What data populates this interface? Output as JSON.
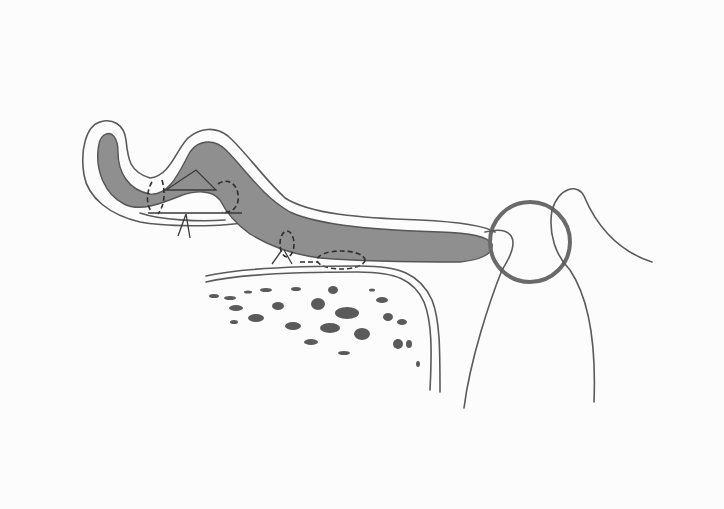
{
  "figure": {
    "type": "anatomical-illustration",
    "style": "hand-drawn pencil sketch, grayscale",
    "labels": [],
    "colors": {
      "background": "#fcfcfc",
      "tissue_fill": "#8f8f8f",
      "outline": "#5a5a5a",
      "dashed_marks": "#2e2e2e",
      "ring": "#6a6a6a"
    },
    "elements": [
      {
        "id": "folded-flap",
        "description": "S-shaped folded tissue flap with shaded core and outer membrane outline"
      },
      {
        "id": "dashed-marks-fold",
        "description": "Two dashed oval/rectangular markings at the fold with a triangular outline"
      },
      {
        "id": "pointer-lines",
        "description": "Small V-shaped pointer lines beneath the fold"
      },
      {
        "id": "dashed-marks-base",
        "description": "Dashed markings where the flap contacts the underlying bone"
      },
      {
        "id": "bone",
        "description": "Bone block with double cortical outline and cancellous speckled interior"
      },
      {
        "id": "ring",
        "description": "Circular ring at the tip of the flap"
      },
      {
        "id": "loops",
        "description": "Two long intersecting curved lines passing through the ring"
      }
    ]
  }
}
